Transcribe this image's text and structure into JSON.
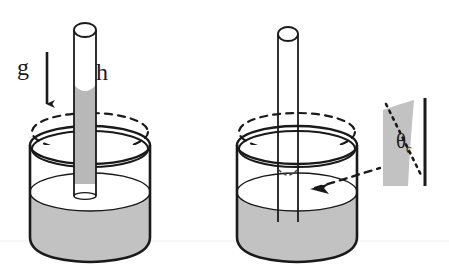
{
  "figure": {
    "type": "diagram",
    "background_color": "#ffffff",
    "liquid_color": "#c2c2c2",
    "outline_color": "#1a1a1a",
    "panels": [
      {
        "id": "left-panel",
        "name": "capillary-rise",
        "description": "Beaker with vertical capillary tube; liquid rises inside tube above bath level with concave meniscus",
        "tube_liquid": "filled",
        "meniscus": "concave"
      },
      {
        "id": "right-panel",
        "name": "capillary-depression",
        "description": "Beaker with vertical capillary tube; liquid inside tube is depressed below bath level",
        "tube_liquid": "empty",
        "meniscus": "depressed"
      }
    ]
  },
  "labels": {
    "gravity": "g",
    "height": "h",
    "contact_angle": "θ",
    "contact_angle_subscript": "c"
  },
  "annotations": {
    "gravity_arrow": "downward-arrow",
    "leader_line": "dashed-arrow-to-meniscus",
    "inset": {
      "name": "contact-angle-detail",
      "wall": "solid-vertical-line",
      "tangent": "dotted-line",
      "wedge": "gray-liquid-wedge"
    }
  },
  "colors": {
    "liquid": "#c2c2c2",
    "liquid_dark": "#b4b4b4",
    "outline": "#1a1a1a",
    "scanline": "#eeeeee"
  }
}
